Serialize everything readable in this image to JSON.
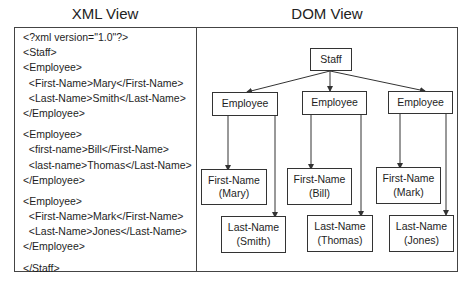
{
  "headers": {
    "xml_view": "XML View",
    "dom_view": "DOM View"
  },
  "xml_lines": [
    "<?xml version=\"1.0\"?>",
    "<Staff>",
    "<Employee>",
    "  <First-Name>Mary</First-Name>",
    "  <Last-Name>Smith</Last-Name>",
    "</Employee>",
    "",
    "<Employee>",
    "  <first-name>Bill</First-Name>",
    "  <last-name>Thomas</Last-Name>",
    "</Employee>",
    "",
    "<Employee>",
    "  <First-Name>Mark</First-Name>",
    "  <Last-Name>Jones</Last-Name>",
    "</Employee>",
    "",
    "</Staff>"
  ],
  "dom_tree": {
    "root": {
      "label": "Staff"
    },
    "employees": [
      {
        "label": "Employee",
        "first_name": {
          "label": "First-Name",
          "value": "(Mary)"
        },
        "last_name": {
          "label": "Last-Name",
          "value": "(Smith)"
        }
      },
      {
        "label": "Employee",
        "first_name": {
          "label": "First-Name",
          "value": "(Bill)"
        },
        "last_name": {
          "label": "Last-Name",
          "value": "(Thomas)"
        }
      },
      {
        "label": "Employee",
        "first_name": {
          "label": "First-Name",
          "value": "(Mark)"
        },
        "last_name": {
          "label": "Last-Name",
          "value": "(Jones)"
        }
      }
    ]
  },
  "colors": {
    "line": "#333333",
    "text": "#1e1e1e",
    "background": "#ffffff"
  }
}
